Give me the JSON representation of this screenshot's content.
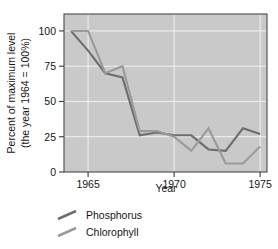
{
  "chart_data": {
    "type": "line",
    "title": "",
    "xlabel": "Year",
    "ylabel": "Percent of maximum level (the year 1964 = 100%)",
    "ylabel_line1": "Percent of maximum level",
    "ylabel_line2": "(the year 1964 = 100%)",
    "xlim": [
      1963.6,
      1975.4
    ],
    "ylim": [
      0,
      112
    ],
    "grid": true,
    "legend_position": "below-axes-left",
    "xticks": [
      1965,
      1970,
      1975
    ],
    "xtick_labels": [
      "1965",
      "1970",
      "1975"
    ],
    "yticks": [
      0,
      25,
      50,
      75,
      100
    ],
    "ytick_labels": [
      "0",
      "25",
      "50",
      "75",
      "100"
    ],
    "gridlines_y": [
      25,
      50,
      75,
      100
    ],
    "gridlines_x": [
      1965,
      1970,
      1975
    ],
    "x": [
      1964,
      1965,
      1966,
      1967,
      1968,
      1969,
      1970,
      1971,
      1972,
      1973,
      1974,
      1975
    ],
    "series": [
      {
        "name": "Phosphorus",
        "color": "#6e6e6e",
        "values": [
          100,
          86,
          70,
          67,
          26,
          28,
          26,
          26,
          16,
          15,
          31,
          27
        ]
      },
      {
        "name": "Chlorophyll",
        "color": "#9a9a9a",
        "values": [
          100,
          100,
          70,
          75,
          29,
          29,
          25,
          15,
          31,
          6,
          6,
          18
        ]
      }
    ]
  },
  "legend": {
    "items": [
      {
        "label": "Phosphorus",
        "color": "#6e6e6e"
      },
      {
        "label": "Chlorophyll",
        "color": "#9a9a9a"
      }
    ]
  },
  "axes": {
    "x_title": "Year",
    "y_title_line1": "Percent of maximum level",
    "y_title_line2": "(the year 1964 = 100%)"
  },
  "colors": {
    "plot_background": "#c9c9c9",
    "grid": "#f2f2f2",
    "frame": "#4a4a4a",
    "page_background": "#ffffff",
    "text": "#151515"
  }
}
